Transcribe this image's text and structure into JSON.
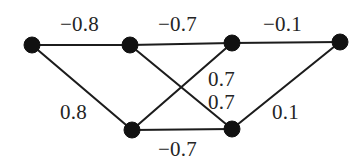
{
  "figure": {
    "background_color": "#ffffff",
    "ink_color": "#1c1c1c",
    "node_color": "#111111",
    "label_color": "#242424"
  },
  "chart_data": {
    "type": "diagram",
    "diagram_kind": "weighted-undirected-graph",
    "title": "",
    "xlabel": "",
    "ylabel": "",
    "grid": false,
    "legend": null,
    "node_radius": 8,
    "nodes": [
      {
        "id": "n1",
        "label": "",
        "x": 32,
        "y": 45
      },
      {
        "id": "n2",
        "label": "",
        "x": 130,
        "y": 45
      },
      {
        "id": "n3",
        "label": "",
        "x": 232,
        "y": 43
      },
      {
        "id": "n4",
        "label": "",
        "x": 340,
        "y": 42
      },
      {
        "id": "n5",
        "label": "",
        "x": 132,
        "y": 130
      },
      {
        "id": "n6",
        "label": "",
        "x": 232,
        "y": 129
      }
    ],
    "edges": [
      {
        "id": "e1",
        "source": "n1",
        "target": "n2",
        "weight": -0.8,
        "weight_text": "−0.8",
        "label_x": 60,
        "label_y": 14
      },
      {
        "id": "e2",
        "source": "n2",
        "target": "n3",
        "weight": -0.7,
        "weight_text": "−0.7",
        "label_x": 158,
        "label_y": 14
      },
      {
        "id": "e3",
        "source": "n3",
        "target": "n4",
        "weight": -0.1,
        "weight_text": "−0.1",
        "label_x": 263,
        "label_y": 14
      },
      {
        "id": "e4",
        "source": "n1",
        "target": "n5",
        "weight": 0.8,
        "weight_text": "0.8",
        "label_x": 60,
        "label_y": 102
      },
      {
        "id": "e5",
        "source": "n2",
        "target": "n6",
        "weight": 0.7,
        "weight_text": "0.7",
        "label_x": 208,
        "label_y": 69
      },
      {
        "id": "e6",
        "source": "n3",
        "target": "n5",
        "weight": 0.7,
        "weight_text": "0.7",
        "label_x": 208,
        "label_y": 92
      },
      {
        "id": "e7",
        "source": "n4",
        "target": "n6",
        "weight": 0.1,
        "weight_text": "0.1",
        "label_x": 272,
        "label_y": 102
      },
      {
        "id": "e8",
        "source": "n5",
        "target": "n6",
        "weight": -0.7,
        "weight_text": "−0.7",
        "label_x": 158,
        "label_y": 139
      }
    ]
  }
}
